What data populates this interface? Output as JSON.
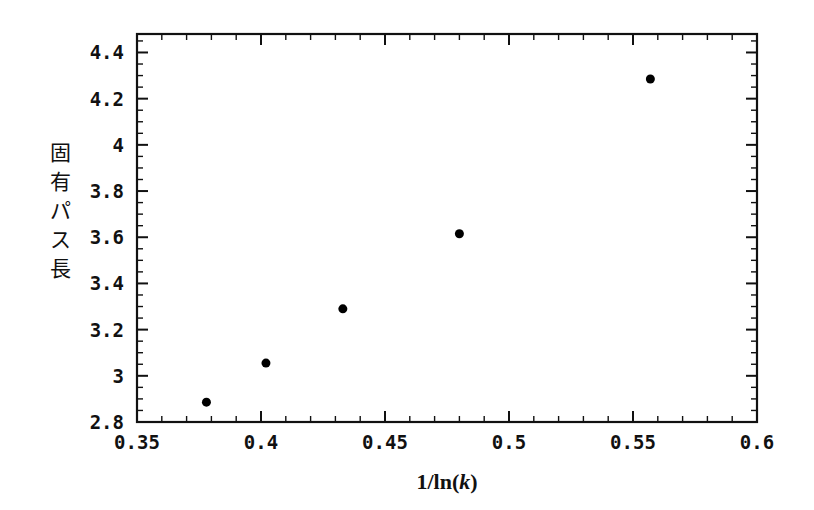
{
  "figure": {
    "background_color": "#ffffff",
    "marker_color": "#000000",
    "axis_color": "#111111"
  },
  "chart_data": {
    "type": "scatter",
    "title": "",
    "subtitle": "",
    "xlabel": "1/ln(k)",
    "xlabel_parts": {
      "prefix": "1/ln(",
      "italic": "k",
      "suffix": ")"
    },
    "ylabel": "固有パス長",
    "ylabel_chars": [
      "固",
      "有",
      "パ",
      "ス",
      "長"
    ],
    "xlim": [
      0.35,
      0.6
    ],
    "ylim": [
      2.8,
      4.48
    ],
    "x_major_ticks": [
      0.35,
      0.4,
      0.45,
      0.5,
      0.55,
      0.6
    ],
    "x_tick_labels": [
      "0.35",
      "0.4",
      "0.45",
      "0.5",
      "0.55",
      "0.6"
    ],
    "x_minor_step": 0.01,
    "y_major_ticks": [
      2.8,
      3.0,
      3.2,
      3.4,
      3.6,
      3.8,
      4.0,
      4.2,
      4.4
    ],
    "y_tick_labels": [
      "2.8",
      "3",
      "3.2",
      "3.4",
      "3.6",
      "3.8",
      "4",
      "4.2",
      "4.4"
    ],
    "y_minor_step": 0.05,
    "grid": false,
    "legend": false,
    "legend_position": "none",
    "x": [
      0.378,
      0.402,
      0.433,
      0.48,
      0.557
    ],
    "y": [
      2.886,
      3.055,
      3.29,
      3.615,
      4.285
    ],
    "points": [
      {
        "x": 0.378,
        "y": 2.886
      },
      {
        "x": 0.402,
        "y": 3.055
      },
      {
        "x": 0.433,
        "y": 3.29
      },
      {
        "x": 0.48,
        "y": 3.615
      },
      {
        "x": 0.557,
        "y": 4.285
      }
    ],
    "marker": "filled-circle",
    "marker_size": 9
  }
}
